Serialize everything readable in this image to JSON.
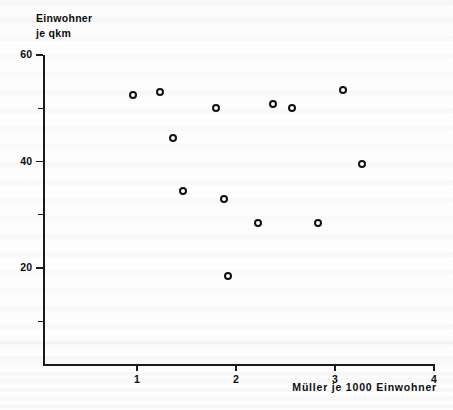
{
  "chart_data": {
    "type": "scatter",
    "title": "",
    "ylabel_lines": [
      "Einwohner",
      "je qkm"
    ],
    "xlabel": "Müller je 1000 Einwohner",
    "xlim": [
      0,
      4
    ],
    "ylim": [
      0,
      60
    ],
    "x_ticks": [
      1,
      2,
      3,
      4
    ],
    "x_tick_labels": [
      "1",
      "2",
      "3",
      "4"
    ],
    "y_ticks": [
      20,
      40,
      60
    ],
    "y_tick_labels": [
      "20",
      "40",
      "60"
    ],
    "y_minor_ticks": [
      10,
      30,
      50
    ],
    "grid": false,
    "legend": null,
    "marker": "open-circle",
    "points": [
      {
        "x": 0.96,
        "y": 52.5
      },
      {
        "x": 1.23,
        "y": 53.0
      },
      {
        "x": 1.36,
        "y": 44.5
      },
      {
        "x": 1.46,
        "y": 34.5
      },
      {
        "x": 1.8,
        "y": 50.0
      },
      {
        "x": 1.88,
        "y": 33.0
      },
      {
        "x": 1.92,
        "y": 18.5
      },
      {
        "x": 2.22,
        "y": 28.5
      },
      {
        "x": 2.37,
        "y": 50.8
      },
      {
        "x": 2.57,
        "y": 50.0
      },
      {
        "x": 2.83,
        "y": 28.5
      },
      {
        "x": 3.08,
        "y": 53.5
      },
      {
        "x": 3.27,
        "y": 39.5
      }
    ]
  }
}
